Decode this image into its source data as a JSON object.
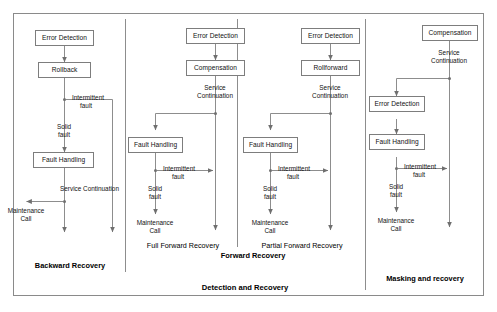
{
  "diagram": {
    "title": "Detection and Recovery",
    "outer_border_color": "#8a8a8a",
    "box_border_color": "#7d7d7d",
    "line_color": "#8d8d8d",
    "text_color": "#111111",
    "grand_label": "Detection and Recovery",
    "columns": [
      {
        "id": "backward-recovery",
        "name": "Backward Recovery",
        "nodes": [
          {
            "id": "error-detection",
            "label": "Error Detection"
          },
          {
            "id": "rollback",
            "label": "Rollback"
          },
          {
            "id": "fault-handling",
            "label": "Fault Handling"
          }
        ],
        "edge_labels": [
          {
            "id": "intermittent-fault",
            "label": "Intermittent\nfault",
            "line1": "Intermittent",
            "line2": "fault"
          },
          {
            "id": "solid-fault",
            "label": "Solid\nfault",
            "line1": "Solid",
            "line2": "fault"
          },
          {
            "id": "service-continuation",
            "label": "Service Continuation",
            "line1": "Service Continuation",
            "line2": ""
          },
          {
            "id": "maintenance-call",
            "label": "Maintenance\nCall",
            "line1": "Maintenance",
            "line2": "Call"
          }
        ]
      },
      {
        "id": "full-forward-recovery",
        "name": "Full Forward Recovery",
        "nodes": [
          {
            "id": "error-detection",
            "label": "Error Detection"
          },
          {
            "id": "compensation",
            "label": "Compensation"
          },
          {
            "id": "fault-handling",
            "label": "Fault Handling"
          }
        ],
        "edge_labels": [
          {
            "id": "service-continuation",
            "label": "Service\nContinuation",
            "line1": "Service",
            "line2": "Continuation"
          },
          {
            "id": "intermittent-fault",
            "label": "Intermittent\nfault",
            "line1": "Intermittent",
            "line2": "fault"
          },
          {
            "id": "solid-fault",
            "label": "Solid\nfault",
            "line1": "Solid",
            "line2": "fault"
          },
          {
            "id": "maintenance-call",
            "label": "Maintenance\nCall",
            "line1": "Maintenance",
            "line2": "Call"
          }
        ]
      },
      {
        "id": "partial-forward-recovery",
        "name": "Partial Forward Recovery",
        "nodes": [
          {
            "id": "error-detection",
            "label": "Error Detection"
          },
          {
            "id": "rollforward",
            "label": "Rollforward"
          },
          {
            "id": "fault-handling",
            "label": "Fault Handling"
          }
        ],
        "edge_labels": [
          {
            "id": "service-continuation",
            "label": "Service\nContinuation",
            "line1": "Service",
            "line2": "Continuation"
          },
          {
            "id": "intermittent-fault",
            "label": "Intermittent\nfault",
            "line1": "Intermittent",
            "line2": "fault"
          },
          {
            "id": "solid-fault",
            "label": "Solid\nfault",
            "line1": "Solid",
            "line2": "fault"
          },
          {
            "id": "maintenance-call",
            "label": "Maintenance\nCall",
            "line1": "Maintenance",
            "line2": "Call"
          }
        ]
      },
      {
        "id": "masking-and-recovery",
        "name": "Masking and recovery",
        "nodes": [
          {
            "id": "compensation",
            "label": "Compensation"
          },
          {
            "id": "error-detection",
            "label": "Error Detection"
          },
          {
            "id": "fault-handling",
            "label": "Fault Handling"
          }
        ],
        "edge_labels": [
          {
            "id": "service-continuation",
            "label": "Service\nContinuation",
            "line1": "Service",
            "line2": "Continuation"
          },
          {
            "id": "intermittent-fault",
            "label": "Intermittent\nfault",
            "line1": "Intermittent",
            "line2": "fault"
          },
          {
            "id": "solid-fault",
            "label": "Solid\nfault",
            "line1": "Solid",
            "line2": "fault"
          },
          {
            "id": "maintenance-call",
            "label": "Maintenance\nCall",
            "line1": "Maintenance",
            "line2": "Call"
          }
        ]
      }
    ]
  }
}
